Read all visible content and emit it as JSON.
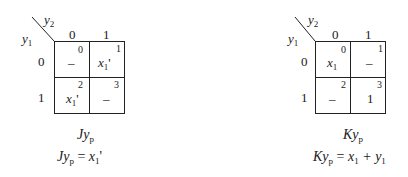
{
  "maps": [
    {
      "id": "Jyp",
      "row_var": "y",
      "row_var_sub": "1",
      "col_var": "y",
      "col_var_sub": "2",
      "col_headers": [
        "0",
        "1"
      ],
      "row_headers": [
        "0",
        "1"
      ],
      "cells": [
        {
          "index": "0",
          "value": "–",
          "sub": "",
          "prime": ""
        },
        {
          "index": "1",
          "value": "x",
          "sub": "1",
          "prime": "'"
        },
        {
          "index": "2",
          "value": "x",
          "sub": "1",
          "prime": "'"
        },
        {
          "index": "3",
          "value": "–",
          "sub": "",
          "prime": ""
        }
      ],
      "title_main": "Jy",
      "title_sub": "p",
      "equation_lhs": "Jy",
      "equation_lhs_sub": "p",
      "equation_eq": " = ",
      "equation_rhs": "x",
      "equation_rhs_sub": "1",
      "equation_rhs_tail": "'"
    },
    {
      "id": "Kyp",
      "row_var": "y",
      "row_var_sub": "1",
      "col_var": "y",
      "col_var_sub": "2",
      "col_headers": [
        "0",
        "1"
      ],
      "row_headers": [
        "0",
        "1"
      ],
      "cells": [
        {
          "index": "0",
          "value": "x",
          "sub": "1",
          "prime": ""
        },
        {
          "index": "1",
          "value": "–",
          "sub": "",
          "prime": ""
        },
        {
          "index": "2",
          "value": "–",
          "sub": "",
          "prime": ""
        },
        {
          "index": "3",
          "value": "1",
          "sub": "",
          "prime": ""
        }
      ],
      "title_main": "Ky",
      "title_sub": "p",
      "equation_lhs": "Ky",
      "equation_lhs_sub": "p",
      "equation_eq": " = ",
      "equation_rhs": "x",
      "equation_rhs_sub": "1",
      "equation_rhs_tail": " + y",
      "equation_rhs_tail_sub": "1"
    }
  ]
}
